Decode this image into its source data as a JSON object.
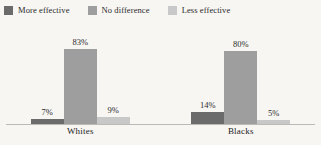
{
  "chart_data": {
    "type": "bar",
    "title": "",
    "subtitle": "",
    "xlabel": "",
    "ylabel": "",
    "ylim": [
      0,
      100
    ],
    "grid": false,
    "legend_position": "top-left",
    "categories": [
      "Whites",
      "Blacks"
    ],
    "series": [
      {
        "name": "More effective",
        "color": "#6b6b6b",
        "values": [
          7,
          14
        ],
        "labels": [
          "7%",
          "14%"
        ]
      },
      {
        "name": "No difference",
        "color": "#9e9e9e",
        "values": [
          83,
          80
        ],
        "labels": [
          "83%",
          "80%"
        ]
      },
      {
        "name": "Less effective",
        "color": "#c8c8c8",
        "values": [
          9,
          5
        ],
        "labels": [
          "9%",
          "5%"
        ]
      }
    ]
  },
  "legend": {
    "items": [
      {
        "label": "More effective",
        "color": "#6b6b6b"
      },
      {
        "label": "No difference",
        "color": "#9e9e9e"
      },
      {
        "label": "Less effective",
        "color": "#c8c8c8"
      }
    ]
  },
  "axis": {
    "categories": [
      "Whites",
      "Blacks"
    ]
  },
  "colors": {
    "background": "#f7f6f3",
    "baseline": "#bdbab4",
    "text": "#2a2a2a"
  }
}
